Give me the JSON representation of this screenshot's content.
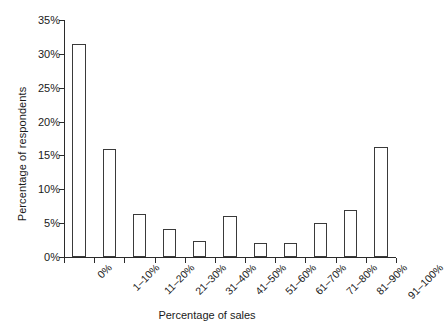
{
  "chart_data": {
    "type": "bar",
    "title": "",
    "xlabel": "Percentage of sales",
    "ylabel": "Percentage of respondents",
    "categories": [
      "0%",
      "1–10%",
      "11–20%",
      "21–30%",
      "31–40%",
      "41–50%",
      "51–60%",
      "61–70%",
      "71–80%",
      "81–90%",
      "91–100%"
    ],
    "values": [
      31.5,
      16.0,
      6.4,
      4.2,
      2.3,
      6.0,
      2.1,
      2.1,
      5.0,
      7.0,
      16.2
    ],
    "ylim": [
      0,
      35
    ],
    "ytick_values": [
      0,
      5,
      10,
      15,
      20,
      25,
      30,
      35
    ],
    "ytick_labels": [
      "0%",
      "5%",
      "10%",
      "15%",
      "20%",
      "25%",
      "30%",
      "35%"
    ],
    "grid": false,
    "legend": "none",
    "bar_fill_color": "#ffffff",
    "bar_edge_color": "#3a3a3a",
    "axis_color": "#2b2b2b",
    "background_color": "#ffffff",
    "xtick_rotation": -45
  }
}
